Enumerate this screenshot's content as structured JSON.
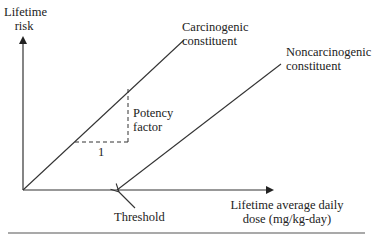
{
  "diagram": {
    "type": "dose-response",
    "y_axis_label": [
      "Lifetime",
      "risk"
    ],
    "x_axis_label": [
      "Lifetime average daily",
      "dose (mg/kg-day)"
    ],
    "series": [
      {
        "name": "carcinogenic",
        "label": [
          "Carcinogenic",
          "constituent"
        ],
        "starts_at": "origin"
      },
      {
        "name": "noncarcinogenic",
        "label": [
          "Noncarcinogenic",
          "constituent"
        ],
        "starts_at": "threshold"
      }
    ],
    "slope_annotation": {
      "rise_label": [
        "Potency",
        "factor"
      ],
      "run_label": "1"
    },
    "threshold_label": "Threshold",
    "colors": {
      "line": "#333333",
      "text": "#222222",
      "background": "#ffffff"
    }
  }
}
